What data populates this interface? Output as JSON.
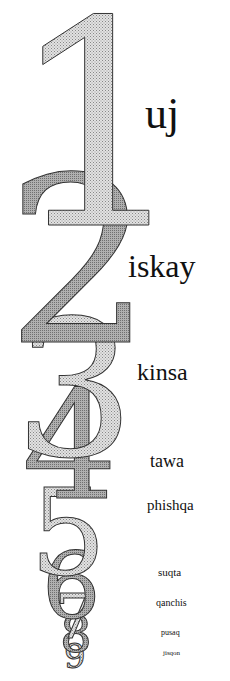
{
  "poster": {
    "background": "#ffffff",
    "text_color": "#111111",
    "numeral_fill_light": "#d8d8d8",
    "numeral_fill_dark": "#a8a8a8",
    "numeral_stroke": "#333333"
  },
  "numerals": [
    {
      "digit": "1",
      "word": "uj"
    },
    {
      "digit": "2",
      "word": "iskay"
    },
    {
      "digit": "3",
      "word": "kinsa"
    },
    {
      "digit": "4",
      "word": "tawa"
    },
    {
      "digit": "5",
      "word": "phishqa"
    },
    {
      "digit": "6",
      "word": "suqta"
    },
    {
      "digit": "7",
      "word": "qanchis"
    },
    {
      "digit": "8",
      "word": "pusaq"
    },
    {
      "digit": "9",
      "word": "jisqon"
    }
  ]
}
